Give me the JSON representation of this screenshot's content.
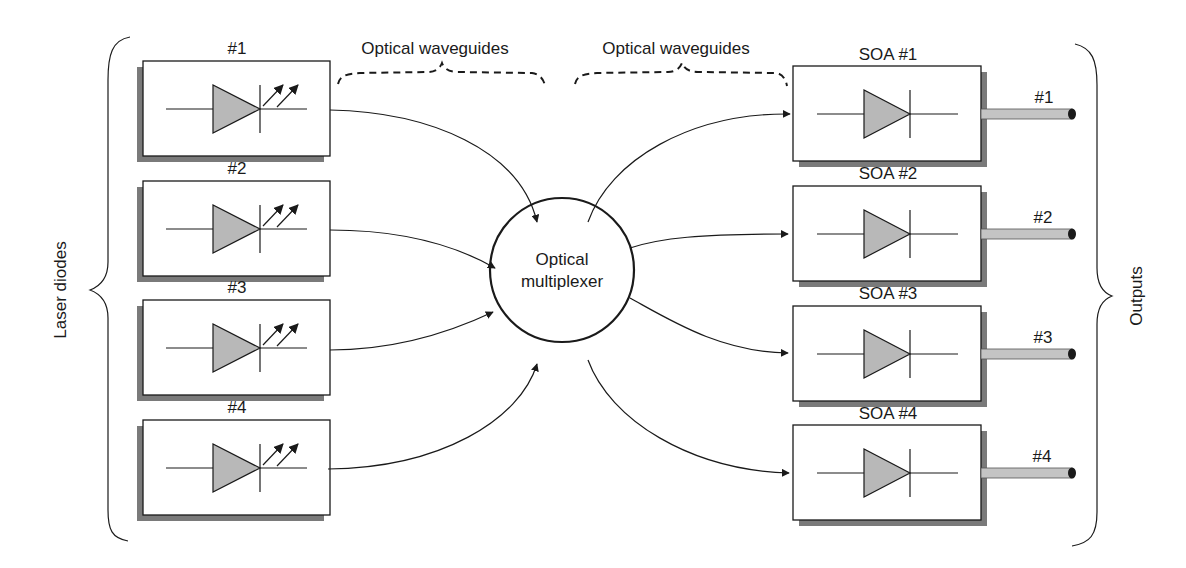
{
  "diagram": {
    "left_group_label": "Laser diodes",
    "right_group_label": "Outputs",
    "waveguide_labels": [
      "Optical waveguides",
      "Optical waveguides"
    ],
    "multiplexer": {
      "line1": "Optical",
      "line2": "multiplexer"
    },
    "lasers": [
      {
        "label": "#1"
      },
      {
        "label": "#2"
      },
      {
        "label": "#3"
      },
      {
        "label": "#4"
      }
    ],
    "amplifiers": [
      {
        "label": "SOA #1",
        "output_label": "#1"
      },
      {
        "label": "SOA #2",
        "output_label": "#2"
      },
      {
        "label": "SOA #3",
        "output_label": "#3"
      },
      {
        "label": "SOA #4",
        "output_label": "#4"
      }
    ],
    "colors": {
      "stroke": "#1a1a1a",
      "diode_fill": "#b8b8b8",
      "shadow": "#7a7a7a",
      "rod_fill": "#c4c4c4"
    }
  }
}
